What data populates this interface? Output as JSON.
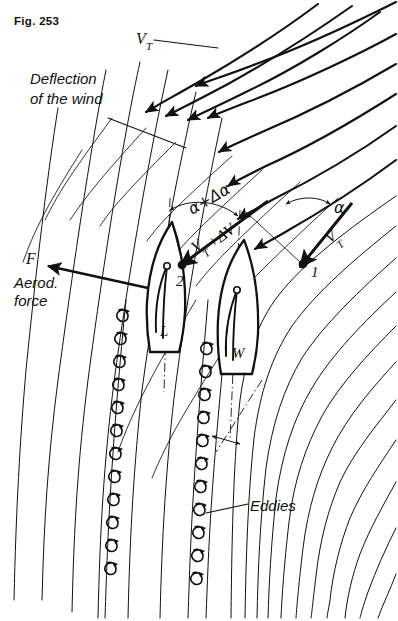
{
  "figure": {
    "caption": "Fig. 253",
    "width": 398,
    "height": 621,
    "background": "#ffffff",
    "ink_color": "#111111"
  },
  "labels": {
    "true_wind_top": "V",
    "true_wind_top_sub": "T",
    "deflection_line1": "Deflection",
    "deflection_line2": "of the wind",
    "force_symbol": "F",
    "force_line1": "Aerod.",
    "force_line2": "force",
    "eddies": "Eddies",
    "angle_alpha": "α",
    "angle_alpha_delta": "α+Δα",
    "vector_vt": "V",
    "vector_vt_sub": "T",
    "vector_vt_delta": "V",
    "vector_vt_delta_sub": "T",
    "vector_vt_delta_rest": "+ΔV",
    "boat_leeward": "L",
    "boat_windward": "W",
    "marker_one": "1",
    "marker_two": "2"
  },
  "annotations": [
    {
      "name": "true-wind-top",
      "text": "V_T",
      "meaning": "true wind velocity (undisturbed, upper right)"
    },
    {
      "name": "deflection-note",
      "text": "Deflection of the wind",
      "meaning": "streamline bending caused by the sails"
    },
    {
      "name": "aerodynamic-force",
      "text": "F  Aerod. force",
      "meaning": "resultant aerodynamic force on leeward boat"
    },
    {
      "name": "eddies-note",
      "text": "Eddies",
      "meaning": "vortex street shed in the wake"
    },
    {
      "name": "angle-1",
      "text": "α",
      "meaning": "apparent wind angle at boat 1 (windward)"
    },
    {
      "name": "angle-2",
      "text": "α+Δα",
      "meaning": "increased wind angle at boat 2 (leeward)"
    },
    {
      "name": "vector-1",
      "text": "V_T",
      "meaning": "true wind vector at station 1"
    },
    {
      "name": "vector-2",
      "text": "V_T+ΔV",
      "meaning": "modified wind vector at station 2"
    }
  ],
  "boats": [
    {
      "id": "windward",
      "label": "W",
      "marker": "1",
      "role": "windward boat, upwind, undisturbed flow"
    },
    {
      "id": "leeward",
      "label": "L",
      "marker": "2",
      "role": "leeward boat, in deflected/ disturbed flow"
    }
  ],
  "flow": {
    "thick_streamline_count": 9,
    "thin_streamline_count": 16,
    "eddy_column_count": 2,
    "eddies_left_column": 12,
    "eddies_right_column": 11,
    "direction": "wind enters from upper right, deflects downward past the sails"
  }
}
